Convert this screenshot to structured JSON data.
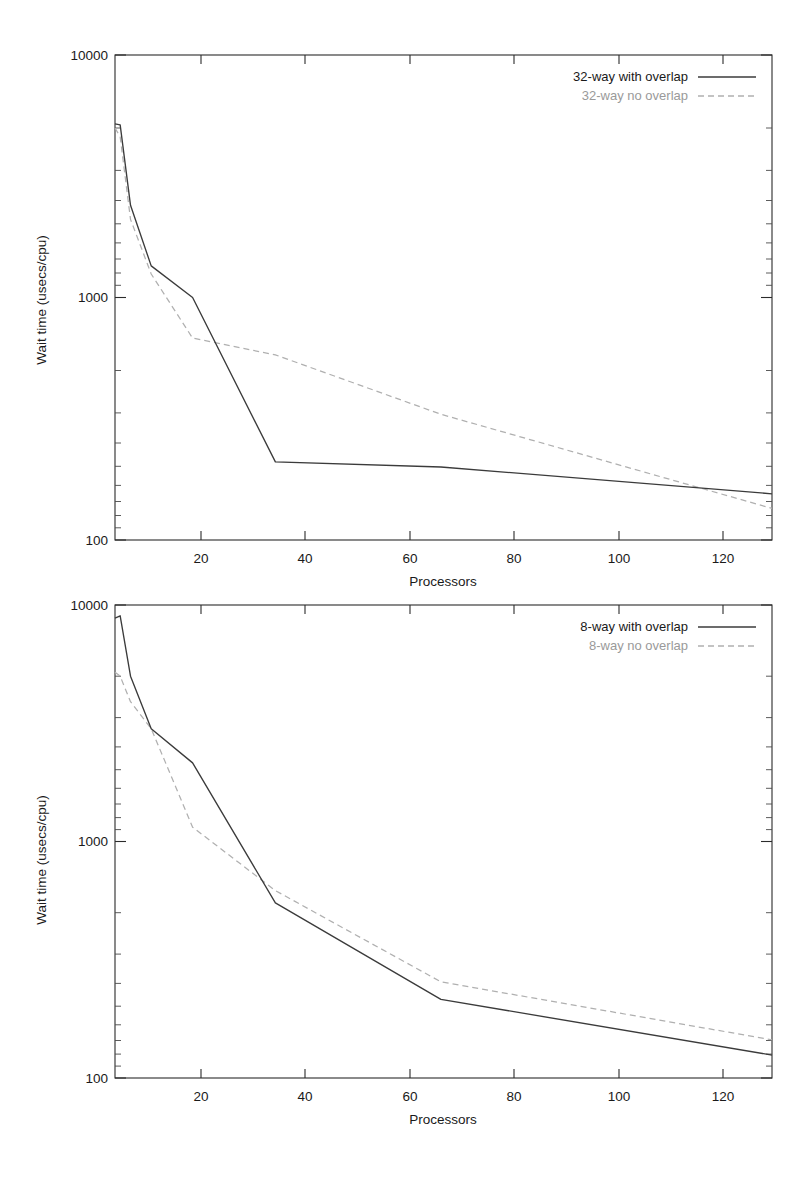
{
  "page": {
    "background": "#ffffff",
    "width": 806,
    "height": 1188
  },
  "colors": {
    "solid_series": "#3b3b3b",
    "dashed_series": "#b0b0b0",
    "axis": "#2b2b2b",
    "text": "#1a1a1a",
    "dashed_label": "#9a9a9a"
  },
  "chart_data": [
    {
      "type": "line",
      "id": "top-chart",
      "title": "",
      "xlabel": "Processors",
      "ylabel": "Wait time (usecs/cpu)",
      "xscale": "linear",
      "yscale": "log",
      "xlim": [
        1,
        128
      ],
      "ylim": [
        100,
        10000
      ],
      "xticks": [
        20,
        40,
        60,
        80,
        100,
        120
      ],
      "xtick_labels": [
        "20",
        "40",
        "60",
        "80",
        "100",
        "120"
      ],
      "yticks": [
        100,
        1000,
        10000
      ],
      "ytick_labels": [
        "100",
        "1000",
        "10000"
      ],
      "grid": false,
      "legend_position": "top-right",
      "series": [
        {
          "name": "32-way with overlap",
          "style": "solid",
          "color": "#3b3b3b",
          "x": [
            1,
            2,
            4,
            8,
            16,
            32,
            64,
            128
          ],
          "values": [
            5200,
            5150,
            2400,
            1350,
            1000,
            210,
            200,
            155
          ]
        },
        {
          "name": "32-way no overlap",
          "style": "dashed",
          "color": "#b0b0b0",
          "x": [
            1,
            2,
            4,
            8,
            16,
            32,
            64,
            128
          ],
          "values": [
            5000,
            4600,
            2100,
            1250,
            680,
            580,
            330,
            135
          ]
        }
      ]
    },
    {
      "type": "line",
      "id": "bottom-chart",
      "title": "",
      "xlabel": "Processors",
      "ylabel": "Wait time (usecs/cpu)",
      "xscale": "linear",
      "yscale": "log",
      "xlim": [
        1,
        128
      ],
      "ylim": [
        100,
        10000
      ],
      "xticks": [
        20,
        40,
        60,
        80,
        100,
        120
      ],
      "xtick_labels": [
        "20",
        "40",
        "60",
        "80",
        "100",
        "120"
      ],
      "yticks": [
        100,
        1000,
        10000
      ],
      "ytick_labels": [
        "100",
        "1000",
        "10000"
      ],
      "grid": false,
      "legend_position": "top-right",
      "series": [
        {
          "name": "8-way with overlap",
          "style": "solid",
          "color": "#3b3b3b",
          "x": [
            1,
            2,
            4,
            8,
            16,
            32,
            64,
            128
          ],
          "values": [
            8800,
            9000,
            5000,
            3000,
            2150,
            550,
            215,
            125
          ]
        },
        {
          "name": "8-way no overlap",
          "style": "dashed",
          "color": "#b0b0b0",
          "x": [
            1,
            2,
            4,
            8,
            16,
            32,
            64,
            128
          ],
          "values": [
            5200,
            5000,
            3900,
            3000,
            1150,
            620,
            255,
            145
          ]
        }
      ]
    }
  ]
}
